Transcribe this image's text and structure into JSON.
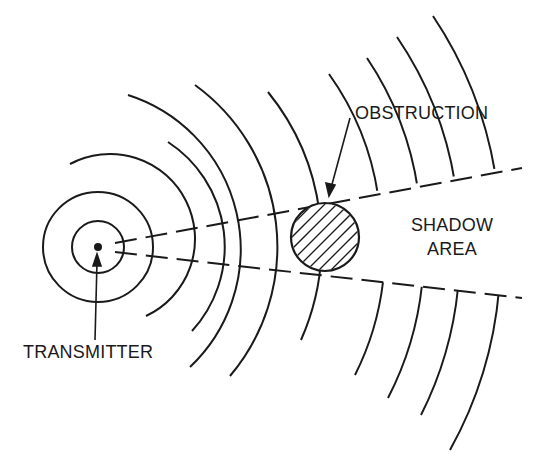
{
  "diagram": {
    "labels": {
      "transmitter": "TRANSMITTER",
      "obstruction": "OBSTRUCTION",
      "shadow_line1": "SHADOW",
      "shadow_line2": "AREA"
    },
    "colors": {
      "ink": "#1a1a1a",
      "background": "#ffffff"
    },
    "transmitter_center": [
      98,
      247
    ],
    "obstruction": {
      "center": [
        325,
        237
      ],
      "radius": 34
    }
  }
}
